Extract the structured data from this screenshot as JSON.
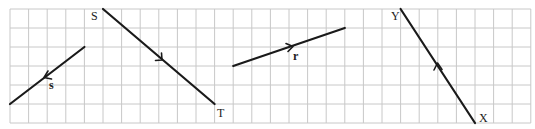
{
  "grid": {
    "origin_x": 10,
    "origin_y": 9,
    "cell_w": 18.6,
    "cell_h": 19,
    "cols": 28,
    "rows": 6,
    "line_color": "#c8c8c8"
  },
  "vectors": [
    {
      "id": "s",
      "label": "s",
      "label_style": "bold",
      "from": [
        4,
        2
      ],
      "to": [
        0,
        5
      ],
      "components": "4 left, 3 down",
      "arrow_at": [
        45,
        77
      ],
      "label_pos": [
        49,
        89
      ]
    },
    {
      "id": "ST",
      "start_label": "S",
      "end_label": "T",
      "from": [
        5,
        0
      ],
      "to": [
        11,
        5
      ],
      "components": "6 right, 5 down",
      "arrow_at": [
        161,
        60
      ],
      "start_label_pos": [
        90,
        20
      ],
      "end_label_pos": [
        217,
        117
      ]
    },
    {
      "id": "r",
      "label": "r",
      "label_style": "bold",
      "from": [
        12,
        3
      ],
      "to": [
        18,
        1
      ],
      "components": "6 right, 2 up",
      "arrow_at": [
        292,
        47
      ],
      "label_pos": [
        293,
        60
      ]
    },
    {
      "id": "XY",
      "start_label": "X",
      "end_label": "Y",
      "from": [
        25,
        6
      ],
      "to": [
        21,
        0
      ],
      "components": "4 left, 6 up",
      "arrow_at": [
        438,
        66
      ],
      "start_label_pos": [
        480,
        122
      ],
      "end_label_pos": [
        390,
        20
      ]
    }
  ],
  "labels": {
    "s": "s",
    "S": "S",
    "T": "T",
    "r": "r",
    "X": "X",
    "Y": "Y"
  },
  "colors": {
    "vector": "#1a1a1a",
    "grid": "#c8c8c8",
    "background": "#ffffff"
  }
}
